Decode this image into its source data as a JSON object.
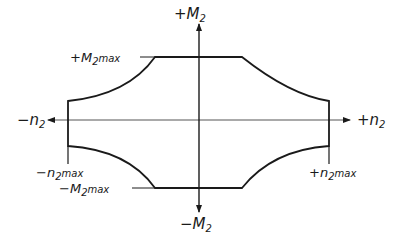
{
  "diagram": {
    "type": "interaction-diagram",
    "axes": {
      "vertical_positive": {
        "sign": "+",
        "base": "M",
        "sub": "2"
      },
      "vertical_negative": {
        "sign": "−",
        "base": "M",
        "sub": "2"
      },
      "horizontal_positive": {
        "sign": "+",
        "base": "n",
        "sub": "2"
      },
      "horizontal_negative": {
        "sign": "−",
        "base": "n",
        "sub": "2"
      }
    },
    "limit_labels": {
      "pos_moment_max": {
        "sign": "+",
        "base": "M",
        "sub": "2",
        "suffix": "max"
      },
      "neg_moment_max": {
        "sign": "−",
        "base": "M",
        "sub": "2",
        "suffix": "max"
      },
      "pos_axial_max": {
        "sign": "+",
        "base": "n",
        "sub": "2",
        "suffix": "max"
      },
      "neg_axial_max": {
        "sign": "−",
        "base": "n",
        "sub": "2",
        "suffix": "max"
      }
    },
    "colors": {
      "line": "#1a1a1a",
      "background": "#ffffff"
    }
  }
}
